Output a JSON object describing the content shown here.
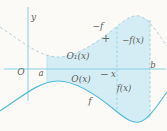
{
  "figure": {
    "labels": {
      "y_axis": "y",
      "origin": "O",
      "point_a": "a",
      "point_x": "x",
      "point_b": "b",
      "curve_upper": "−f",
      "curve_lower": "f",
      "ordinate_upper": "−f(x)",
      "ordinate_lower": "f(x)",
      "area_upper": "O₁(x)",
      "area_lower": "O(x)",
      "plus_sign": "+",
      "minus_sign": "−"
    },
    "colors": {
      "background": "#fbfaf6",
      "region_fill": "#d4edf5",
      "curve_solid": "#4fbcd8",
      "curve_dashed": "#a9ccd8",
      "axis": "#86cfe0",
      "dashed_guide": "#7fcbe0",
      "text": "#5e5e59"
    }
  }
}
